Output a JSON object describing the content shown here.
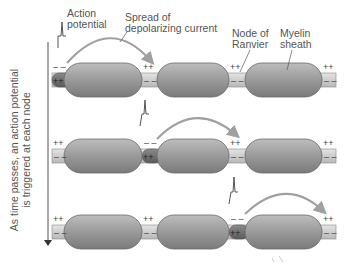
{
  "labels": {
    "action_potential_line1": "Action",
    "action_potential_line2": "potential",
    "spread_line1": "Spread of",
    "spread_line2": "depolarizing current",
    "node_line1": "Node of",
    "node_line2": "Ranvier",
    "myelin_line1": "Myelin",
    "myelin_line2": "sheath",
    "time_line1": "As time passes, an action potential",
    "time_line2": "is triggered at each node"
  },
  "rows": [
    {
      "active_node": 0,
      "charges": [
        "--/++",
        "++/--",
        "++/--",
        "++/--"
      ]
    },
    {
      "active_node": 1,
      "charges": [
        "++/--",
        "--/++",
        "++/--",
        "++/--"
      ]
    },
    {
      "active_node": 2,
      "charges": [
        "++/--",
        "++/--",
        "--/++",
        "++/--"
      ]
    }
  ],
  "colors": {
    "myelin": "#8c8c8c",
    "axon_resting": "#d0d0d0",
    "axon_active": "#6e6e6e",
    "arrow": "#9a9a9a"
  }
}
